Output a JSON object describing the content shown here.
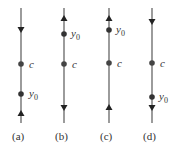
{
  "figure": {
    "panels": [
      {
        "caption": "(a)",
        "x": 21,
        "c_y": 64,
        "y0_y": 94,
        "arrows": [
          {
            "y": 30,
            "dir": "down"
          },
          {
            "y": 113,
            "dir": "up"
          }
        ]
      },
      {
        "caption": "(b)",
        "x": 64,
        "c_y": 64,
        "y0_y": 34,
        "arrows": [
          {
            "y": 18,
            "dir": "up"
          },
          {
            "y": 108,
            "dir": "down"
          }
        ]
      },
      {
        "caption": "(c)",
        "x": 109,
        "c_y": 63,
        "y0_y": 30,
        "arrows": [
          {
            "y": 18,
            "dir": "up"
          },
          {
            "y": 107,
            "dir": "up"
          }
        ]
      },
      {
        "caption": "(d)",
        "x": 152,
        "c_y": 63,
        "y0_y": 97,
        "arrows": [
          {
            "y": 22,
            "dir": "down"
          },
          {
            "y": 108,
            "dir": "down"
          }
        ]
      }
    ],
    "labels": {
      "c": "c",
      "y": "y",
      "sub": "0"
    },
    "captions": [
      "(a)",
      "(b)",
      "(c)",
      "(d)"
    ],
    "line_color": "#555555",
    "dot_color": "#333333"
  }
}
